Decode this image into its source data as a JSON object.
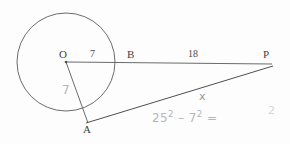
{
  "figure": {
    "background_color": "#fdfdfd",
    "ink_color": "#555555",
    "pencil_color": "#9a9a9a"
  },
  "points": {
    "O": {
      "label": "O",
      "x": 66,
      "y": 62,
      "role": "circle-center"
    },
    "B": {
      "label": "B",
      "x": 115,
      "y": 62,
      "role": "point-on-circle"
    },
    "P": {
      "label": "P",
      "x": 272,
      "y": 66,
      "role": "external-point"
    },
    "A": {
      "label": "A",
      "x": 88,
      "y": 122,
      "role": "tangent-point"
    }
  },
  "circle": {
    "center_x": 66,
    "center_y": 62,
    "radius": 49
  },
  "segments": {
    "OB": {
      "label": "7",
      "label_x": 91,
      "label_y": 51
    },
    "BP": {
      "label": "18",
      "label_x": 193,
      "label_y": 51
    },
    "OA": {
      "label": "7",
      "label_x": 64,
      "label_y": 86
    },
    "AP": {
      "label": "x",
      "label_x": 200,
      "label_y": 92
    }
  },
  "point_labels": {
    "O": {
      "text": "O",
      "x": 60,
      "y": 50
    },
    "B": {
      "text": "B",
      "x": 128,
      "y": 50
    },
    "P": {
      "text": "P",
      "x": 264,
      "y": 50
    },
    "A": {
      "text": "A",
      "x": 84,
      "y": 126
    }
  },
  "handwriting": {
    "equation_base1": "25",
    "equation_exp1": "2",
    "equation_minus": " – ",
    "equation_base2": "7",
    "equation_exp2": "2",
    "equation_equals": " =",
    "equation_x": 152,
    "equation_y": 112,
    "stray_digit": "2",
    "stray_x": 268,
    "stray_y": 106
  }
}
